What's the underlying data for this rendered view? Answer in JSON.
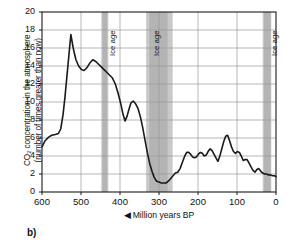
{
  "figure": {
    "panel_label": "b)"
  },
  "chart_data": {
    "type": "line",
    "title": "",
    "xlabel": "◀ Million years BP",
    "xlabel_text": "Million years BP",
    "xlabel_arrow": "◀",
    "ylabel_line1": "CO2 concentration in the atmosphere",
    "ylabel_line2": "(number of times greater than now)",
    "ylabel_prefix": "CO",
    "ylabel_subscript": "2",
    "ylabel_suffix": " concentration in the atmosphere\n(number of times greater than now)",
    "xlim": [
      600,
      0
    ],
    "ylim": [
      0,
      20
    ],
    "x_reversed": true,
    "xticks": [
      600,
      500,
      400,
      300,
      200,
      100,
      0
    ],
    "yticks": [
      0,
      2,
      4,
      6,
      8,
      10,
      12,
      14,
      16,
      18,
      20
    ],
    "grid": true,
    "legend": "none",
    "line_color": "#1a1a1a",
    "grid_color": "#9a9a9a",
    "band_color": "#c9c9c9",
    "band_core_color": "#b4b4b4",
    "series": [
      {
        "name": "CO2 concentration",
        "x": [
          600,
          592,
          583,
          575,
          566,
          558,
          552,
          546,
          541,
          536,
          531,
          526,
          520,
          513,
          506,
          499,
          492,
          485,
          478,
          470,
          462,
          455,
          448,
          441,
          434,
          427,
          420,
          412,
          405,
          398,
          392,
          387,
          382,
          377,
          372,
          366,
          360,
          354,
          348,
          342,
          336,
          330,
          324,
          318,
          312,
          306,
          300,
          294,
          288,
          282,
          276,
          270,
          264,
          258,
          252,
          246,
          240,
          234,
          229,
          224,
          219,
          214,
          209,
          204,
          199,
          194,
          189,
          184,
          179,
          174,
          169,
          164,
          159,
          154,
          149,
          144,
          139,
          134,
          129,
          124,
          119,
          114,
          109,
          104,
          99,
          94,
          89,
          84,
          79,
          74,
          69,
          64,
          59,
          54,
          49,
          44,
          39,
          34,
          29,
          24,
          19,
          14,
          9,
          4,
          0
        ],
        "y": [
          5.0,
          5.7,
          6.1,
          6.3,
          6.4,
          6.5,
          7.0,
          8.6,
          10.6,
          12.9,
          15.2,
          17.5,
          16.0,
          14.7,
          14.0,
          13.6,
          13.5,
          13.8,
          14.3,
          14.7,
          14.5,
          14.2,
          13.9,
          13.6,
          13.3,
          13.0,
          12.7,
          12.0,
          11.0,
          9.8,
          8.6,
          7.9,
          8.4,
          9.2,
          9.9,
          10.1,
          9.8,
          9.3,
          8.4,
          7.2,
          5.8,
          4.4,
          3.2,
          2.3,
          1.6,
          1.2,
          1.1,
          1.0,
          1.0,
          1.0,
          1.2,
          1.5,
          1.8,
          2.1,
          2.2,
          2.6,
          3.3,
          4.0,
          4.4,
          4.4,
          4.2,
          3.9,
          3.8,
          3.9,
          4.2,
          4.4,
          4.3,
          4.0,
          4.1,
          4.5,
          4.8,
          4.6,
          4.2,
          3.8,
          3.4,
          4.0,
          4.8,
          5.6,
          6.2,
          6.3,
          5.7,
          5.0,
          4.5,
          4.3,
          4.5,
          4.4,
          4.0,
          3.5,
          3.6,
          3.6,
          3.2,
          2.8,
          2.4,
          2.2,
          2.5,
          2.6,
          2.3,
          2.1,
          2.0,
          2.0,
          1.9,
          1.9,
          1.8,
          1.8,
          1.7
        ]
      }
    ],
    "bands": [
      {
        "label": "Ice age",
        "x_start": 448,
        "x_end": 430,
        "core_start": 445,
        "core_end": 433,
        "label_x": 440
      },
      {
        "label": "Ice age",
        "x_start": 333,
        "x_end": 265,
        "core_start": 325,
        "core_end": 278,
        "label_x": 327
      },
      {
        "label": "Ice age",
        "x_start": 34,
        "x_end": 12,
        "core_start": 31,
        "core_end": 14,
        "label_x": 26
      }
    ],
    "band_labels": [
      "Ice age",
      "Ice age",
      "Ice age"
    ]
  }
}
